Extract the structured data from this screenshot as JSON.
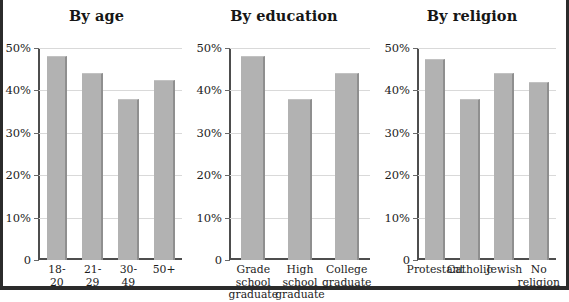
{
  "figure": {
    "background_color": "#ffffff",
    "frame_color": "#2b2b2b",
    "bar_color": "#b2b2b2",
    "bar_shadow_color": "#8f8f8f",
    "gridline_color": "#d9d9d9",
    "axis_color": "#4d4d4d"
  },
  "chart_data": [
    {
      "type": "bar",
      "title": "By age",
      "xlabel": "",
      "ylabel": "",
      "ylim": [
        0,
        50
      ],
      "grid": true,
      "legend": "none",
      "ytick_labels": [
        "50%",
        "40%",
        "30%",
        "20%",
        "10%",
        "0"
      ],
      "ytick_values": [
        50,
        40,
        30,
        20,
        10,
        0
      ],
      "categories": [
        "18-20",
        "21-29",
        "30-49",
        "50+"
      ],
      "values": [
        48,
        44,
        38,
        42.5
      ]
    },
    {
      "type": "bar",
      "title": "By education",
      "xlabel": "",
      "ylabel": "",
      "ylim": [
        0,
        50
      ],
      "grid": true,
      "legend": "none",
      "ytick_labels": [
        "50%",
        "40%",
        "30%",
        "20%",
        "10%",
        "0"
      ],
      "ytick_values": [
        50,
        40,
        30,
        20,
        10,
        0
      ],
      "categories": [
        "Grade\nschool\ngraduate",
        "High\nschool\ngraduate",
        "College\ngraduate"
      ],
      "values": [
        48,
        38,
        44
      ]
    },
    {
      "type": "bar",
      "title": "By religion",
      "xlabel": "",
      "ylabel": "",
      "ylim": [
        0,
        50
      ],
      "grid": true,
      "legend": "none",
      "ytick_labels": [
        "50%",
        "40%",
        "30%",
        "20%",
        "10%",
        "0"
      ],
      "ytick_values": [
        50,
        40,
        30,
        20,
        10,
        0
      ],
      "categories": [
        "Protestant",
        "Catholic",
        "Jewish",
        "No\nreligion"
      ],
      "values": [
        47.5,
        38,
        44,
        42
      ]
    }
  ]
}
